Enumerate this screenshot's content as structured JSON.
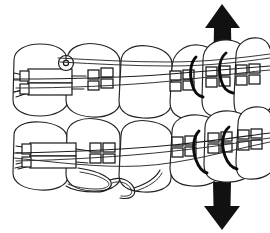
{
  "figure": {
    "title": "Orthodontic appliance diagram — upper and lower dental arches with fixed braces",
    "style": "black-and-white line art"
  },
  "arrows": [
    {
      "name": "up-arrow",
      "direction": "up",
      "label": "Upward force",
      "color": "#111111"
    },
    {
      "name": "down-arrow",
      "direction": "down",
      "label": "Downward force",
      "color": "#111111"
    }
  ],
  "arches": [
    {
      "name": "upper-arch",
      "label": "Upper arch",
      "tooth_count": 6
    },
    {
      "name": "lower-arch",
      "label": "Lower arch",
      "tooth_count": 6
    }
  ],
  "components": [
    {
      "name": "molar-tube-appliance-upper",
      "label": "Upper molar buccal tube appliance"
    },
    {
      "name": "molar-tube-appliance-lower",
      "label": "Lower molar buccal tube appliance"
    },
    {
      "name": "archwire-upper",
      "label": "Upper archwire"
    },
    {
      "name": "archwire-lower",
      "label": "Lower archwire"
    },
    {
      "name": "lingual-wire-loop",
      "label": "Lingual wire loop"
    },
    {
      "name": "hook-loop",
      "label": "Archwire hook loop"
    },
    {
      "name": "vertical-elastic",
      "label": "Vertical elastic",
      "count": 4
    },
    {
      "name": "bracket",
      "label": "Bracket",
      "count": 10
    }
  ],
  "colors": {
    "ink": "#1a1a1a",
    "fill": "#ffffff",
    "arrow": "#111111",
    "elastic": "#0b0b0b"
  }
}
